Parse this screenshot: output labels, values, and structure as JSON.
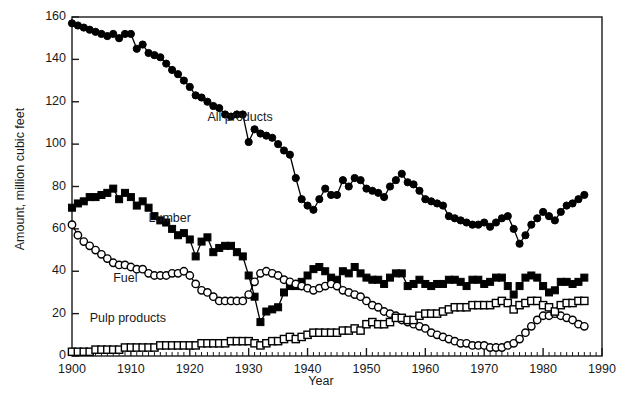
{
  "chart_data": {
    "type": "line",
    "title": "",
    "xlabel": "Year",
    "ylabel": "Amount, million cubic feet",
    "xlim": [
      1900,
      1990
    ],
    "ylim": [
      0,
      160
    ],
    "xticks": [
      1900,
      1910,
      1920,
      1930,
      1940,
      1950,
      1960,
      1970,
      1980,
      1990
    ],
    "yticks": [
      0,
      20,
      40,
      60,
      80,
      100,
      120,
      140,
      160
    ],
    "minor_x_tick_step": 1,
    "grid": false,
    "legend": "inline-annotations",
    "annotations": [
      {
        "text": "All products",
        "x": 1923,
        "y": 112
      },
      {
        "text": "Lumber",
        "x": 1913,
        "y": 64
      },
      {
        "text": "Fuel",
        "x": 1907,
        "y": 36
      },
      {
        "text": "Pulp products",
        "x": 1903,
        "y": 17
      }
    ],
    "series": [
      {
        "name": "All products",
        "marker": "filled-circle",
        "color": "#000000",
        "x": [
          1900,
          1901,
          1902,
          1903,
          1904,
          1905,
          1906,
          1907,
          1908,
          1909,
          1910,
          1911,
          1912,
          1913,
          1914,
          1915,
          1916,
          1917,
          1918,
          1919,
          1920,
          1921,
          1922,
          1923,
          1924,
          1925,
          1926,
          1927,
          1928,
          1929,
          1930,
          1931,
          1932,
          1933,
          1934,
          1935,
          1936,
          1937,
          1938,
          1939,
          1940,
          1941,
          1942,
          1943,
          1944,
          1945,
          1946,
          1947,
          1948,
          1949,
          1950,
          1951,
          1952,
          1953,
          1954,
          1955,
          1956,
          1957,
          1958,
          1959,
          1960,
          1961,
          1962,
          1963,
          1964,
          1965,
          1966,
          1967,
          1968,
          1969,
          1970,
          1971,
          1972,
          1973,
          1974,
          1975,
          1976,
          1977,
          1978,
          1979,
          1980,
          1981,
          1982,
          1983,
          1984,
          1985,
          1986,
          1987
        ],
        "y": [
          157,
          156,
          155,
          154,
          153,
          152,
          151,
          152,
          150,
          152,
          152,
          145,
          147,
          143,
          142,
          141,
          138,
          135,
          133,
          130,
          127,
          123,
          122,
          120,
          118,
          117,
          114,
          113,
          114,
          114,
          101,
          107,
          105,
          104,
          103,
          100,
          97,
          95,
          84,
          74,
          71,
          69,
          74,
          79,
          76,
          76,
          83,
          80,
          84,
          83,
          79,
          78,
          77,
          75,
          80,
          83,
          86,
          82,
          81,
          78,
          74,
          73,
          72,
          71,
          66,
          65,
          64,
          63,
          62,
          62,
          63,
          61,
          63,
          65,
          66,
          60,
          53,
          57,
          62,
          65,
          68,
          66,
          64,
          68,
          71,
          72,
          74,
          76
        ]
      },
      {
        "name": "Lumber",
        "marker": "filled-square",
        "color": "#000000",
        "x": [
          1900,
          1901,
          1902,
          1903,
          1904,
          1905,
          1906,
          1907,
          1908,
          1909,
          1910,
          1911,
          1912,
          1913,
          1914,
          1915,
          1916,
          1917,
          1918,
          1919,
          1920,
          1921,
          1922,
          1923,
          1924,
          1925,
          1926,
          1927,
          1928,
          1929,
          1930,
          1931,
          1932,
          1933,
          1934,
          1935,
          1936,
          1937,
          1938,
          1939,
          1940,
          1941,
          1942,
          1943,
          1944,
          1945,
          1946,
          1947,
          1948,
          1949,
          1950,
          1951,
          1952,
          1953,
          1954,
          1955,
          1956,
          1957,
          1958,
          1959,
          1960,
          1961,
          1962,
          1963,
          1964,
          1965,
          1966,
          1967,
          1968,
          1969,
          1970,
          1971,
          1972,
          1973,
          1974,
          1975,
          1976,
          1977,
          1978,
          1979,
          1980,
          1981,
          1982,
          1983,
          1984,
          1985,
          1986,
          1987
        ],
        "y": [
          70,
          72,
          73,
          75,
          75,
          76,
          77,
          79,
          74,
          77,
          75,
          71,
          73,
          70,
          66,
          64,
          63,
          60,
          57,
          58,
          55,
          47,
          54,
          56,
          49,
          51,
          52,
          52,
          49,
          47,
          38,
          28,
          16,
          21,
          22,
          23,
          30,
          33,
          33,
          35,
          38,
          41,
          42,
          40,
          37,
          36,
          40,
          39,
          42,
          39,
          37,
          36,
          36,
          34,
          37,
          39,
          39,
          33,
          34,
          36,
          34,
          33,
          34,
          34,
          36,
          36,
          35,
          33,
          36,
          36,
          34,
          35,
          37,
          37,
          33,
          29,
          33,
          37,
          38,
          37,
          33,
          30,
          31,
          35,
          35,
          34,
          35,
          37
        ]
      },
      {
        "name": "Fuel",
        "marker": "open-circle",
        "color": "#000000",
        "x": [
          1900,
          1901,
          1902,
          1903,
          1904,
          1905,
          1906,
          1907,
          1908,
          1909,
          1910,
          1911,
          1912,
          1913,
          1914,
          1915,
          1916,
          1917,
          1918,
          1919,
          1920,
          1921,
          1922,
          1923,
          1924,
          1925,
          1926,
          1927,
          1928,
          1929,
          1930,
          1931,
          1932,
          1933,
          1934,
          1935,
          1936,
          1937,
          1938,
          1939,
          1940,
          1941,
          1942,
          1943,
          1944,
          1945,
          1946,
          1947,
          1948,
          1949,
          1950,
          1951,
          1952,
          1953,
          1954,
          1955,
          1956,
          1957,
          1958,
          1959,
          1960,
          1961,
          1962,
          1963,
          1964,
          1965,
          1966,
          1967,
          1968,
          1969,
          1970,
          1971,
          1972,
          1973,
          1974,
          1975,
          1976,
          1977,
          1978,
          1979,
          1980,
          1981,
          1982,
          1983,
          1984,
          1985,
          1986,
          1987
        ],
        "y": [
          62,
          57,
          54,
          52,
          50,
          48,
          46,
          44,
          43,
          43,
          42,
          41,
          41,
          39,
          38,
          38,
          38,
          39,
          39,
          40,
          38,
          34,
          31,
          30,
          28,
          26,
          26,
          26,
          26,
          26,
          29,
          35,
          39,
          40,
          39,
          38,
          36,
          35,
          34,
          33,
          32,
          31,
          32,
          33,
          34,
          33,
          31,
          30,
          29,
          28,
          26,
          24,
          23,
          21,
          20,
          19,
          17,
          16,
          15,
          14,
          13,
          11,
          10,
          9,
          8,
          7,
          6,
          6,
          5,
          5,
          5,
          4,
          4,
          4,
          5,
          6,
          8,
          11,
          14,
          17,
          19,
          19,
          20,
          19,
          18,
          17,
          15,
          14
        ]
      },
      {
        "name": "Pulp products",
        "marker": "open-square",
        "color": "#000000",
        "x": [
          1900,
          1901,
          1902,
          1903,
          1904,
          1905,
          1906,
          1907,
          1908,
          1909,
          1910,
          1911,
          1912,
          1913,
          1914,
          1915,
          1916,
          1917,
          1918,
          1919,
          1920,
          1921,
          1922,
          1923,
          1924,
          1925,
          1926,
          1927,
          1928,
          1929,
          1930,
          1931,
          1932,
          1933,
          1934,
          1935,
          1936,
          1937,
          1938,
          1939,
          1940,
          1941,
          1942,
          1943,
          1944,
          1945,
          1946,
          1947,
          1948,
          1949,
          1950,
          1951,
          1952,
          1953,
          1954,
          1955,
          1956,
          1957,
          1958,
          1959,
          1960,
          1961,
          1962,
          1963,
          1964,
          1965,
          1966,
          1967,
          1968,
          1969,
          1970,
          1971,
          1972,
          1973,
          1974,
          1975,
          1976,
          1977,
          1978,
          1979,
          1980,
          1981,
          1982,
          1983,
          1984,
          1985,
          1986,
          1987
        ],
        "y": [
          2,
          2,
          2,
          2,
          3,
          3,
          3,
          3,
          3,
          4,
          4,
          4,
          4,
          4,
          4,
          5,
          5,
          5,
          5,
          5,
          5,
          5,
          6,
          6,
          6,
          6,
          6,
          7,
          7,
          7,
          7,
          6,
          5,
          6,
          7,
          7,
          8,
          9,
          8,
          9,
          10,
          11,
          11,
          11,
          11,
          11,
          12,
          12,
          13,
          12,
          15,
          16,
          15,
          15,
          16,
          18,
          18,
          17,
          17,
          19,
          20,
          20,
          20,
          21,
          22,
          23,
          23,
          23,
          24,
          24,
          24,
          24,
          25,
          26,
          25,
          22,
          24,
          25,
          26,
          26,
          24,
          23,
          21,
          24,
          25,
          25,
          26,
          26
        ]
      }
    ]
  },
  "axis": {
    "ytick_labels": [
      "0",
      "20",
      "40",
      "60",
      "80",
      "100",
      "120",
      "140",
      "160"
    ],
    "xtick_labels": [
      "1900",
      "1910",
      "1920",
      "1930",
      "1940",
      "1950",
      "1960",
      "1970",
      "1980",
      "1990"
    ]
  }
}
